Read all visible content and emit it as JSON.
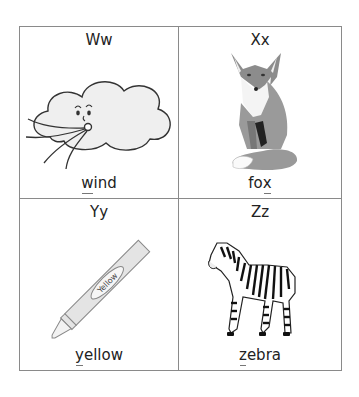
{
  "cards": [
    {
      "letters": "Ww",
      "word_first": "",
      "word_underlined": "w",
      "word_rest": "ind",
      "picture": "wind-cloud-icon"
    },
    {
      "letters": "Xx",
      "word_first": "fo",
      "word_underlined": "x",
      "word_rest": "",
      "picture": "fox-icon"
    },
    {
      "letters": "Yy",
      "word_first": "",
      "word_underlined": "y",
      "word_rest": "ellow",
      "picture": "crayon-icon",
      "crayon_label": "Yellow"
    },
    {
      "letters": "Zz",
      "word_first": "",
      "word_underlined": "z",
      "word_rest": "ebra",
      "picture": "zebra-icon"
    }
  ],
  "colors": {
    "border": "#8a8a8a",
    "text": "#222222",
    "cloud_fill": "#efefef",
    "crayon_fill": "#e4e4e4"
  }
}
